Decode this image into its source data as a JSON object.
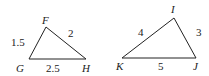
{
  "triangles": [
    {
      "name": "FGH",
      "vertices": {
        "F": "F",
        "G": "G",
        "H": "H"
      },
      "sides": {
        "FG": "1.5",
        "FH": "2",
        "GH": "2.5"
      }
    },
    {
      "name": "IJK",
      "vertices": {
        "I": "I",
        "J": "J",
        "K": "K"
      },
      "sides": {
        "IK": "4",
        "IJ": "3",
        "KJ": "5"
      }
    }
  ],
  "colors": {
    "stroke": "#222222"
  }
}
